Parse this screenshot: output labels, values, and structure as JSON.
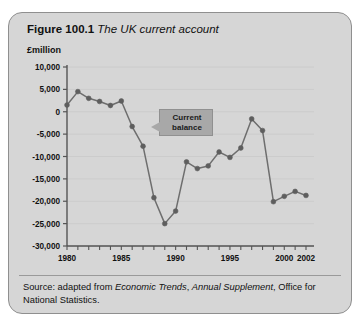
{
  "figure": {
    "label": "Figure 100.1",
    "caption": "The UK current account"
  },
  "axis_unit": "£million",
  "callout": {
    "line1": "Current",
    "line2": "balance"
  },
  "source": {
    "prefix": "Source: adapted from ",
    "italic1": "Economic Trends",
    "mid": ", ",
    "italic2": "Annual Supplement",
    "suffix": ", Office for National Statistics."
  },
  "colors": {
    "card_background": "#d6d6d6",
    "card_border": "#8f8f8f",
    "line": "#6e6e6e",
    "marker": "#5e5e5e",
    "axis": "#555555",
    "gridline": "#c9c9c9",
    "callout_fill": "#a8a8a8",
    "text": "#111111"
  },
  "chart_data": {
    "type": "line",
    "title": "The UK current account",
    "xlabel": "",
    "ylabel": "£million",
    "series_name": "Current balance",
    "grid": true,
    "legend": "none",
    "xlim": [
      1980,
      2002
    ],
    "ylim": [
      -30000,
      10000
    ],
    "ytick_labels": [
      "10,000",
      "5,000",
      "0",
      "-5,000",
      "-10,000",
      "-15,000",
      "-20,000",
      "-25,000",
      "-30,000"
    ],
    "yticks": [
      10000,
      5000,
      0,
      -5000,
      -10000,
      -15000,
      -20000,
      -25000,
      -30000
    ],
    "xtick_labels": [
      "1980",
      "1985",
      "1990",
      "1995",
      "2000",
      "2002"
    ],
    "xticks": [
      1980,
      1985,
      1990,
      1995,
      2000,
      2002
    ],
    "x": [
      1980,
      1981,
      1982,
      1983,
      1984,
      1985,
      1986,
      1987,
      1988,
      1989,
      1990,
      1991,
      1992,
      1993,
      1994,
      1995,
      1996,
      1997,
      1998,
      1999,
      2000,
      2001,
      2002
    ],
    "values": [
      1500,
      4500,
      3000,
      2300,
      1400,
      2400,
      -3300,
      -7700,
      -19200,
      -25000,
      -22200,
      -11200,
      -12700,
      -12100,
      -9000,
      -10200,
      -8100,
      -1600,
      -4200,
      -20100,
      -18900,
      -17800,
      -18700
    ]
  }
}
